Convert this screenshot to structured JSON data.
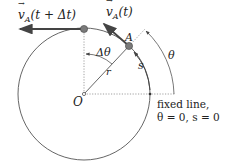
{
  "diagram": {
    "type": "circular-motion",
    "labels": {
      "velocity_later": "v⃗A(t + Δt)",
      "velocity_later_main": "v",
      "velocity_later_sub": "A",
      "velocity_later_arg": "(t + Δt)",
      "velocity_now_main": "v",
      "velocity_now_sub": "A",
      "velocity_now_arg": "(t)",
      "point_a": "A",
      "delta_theta": "Δθ",
      "radius": "r",
      "arc_length": "s",
      "theta": "θ",
      "origin": "O",
      "fixed_line_1": "fixed line,",
      "fixed_line_2": "θ = 0, s = 0"
    },
    "colors": {
      "stroke": "#555555",
      "arrow": "#444444",
      "point": "#777777",
      "text": "#222222"
    }
  }
}
